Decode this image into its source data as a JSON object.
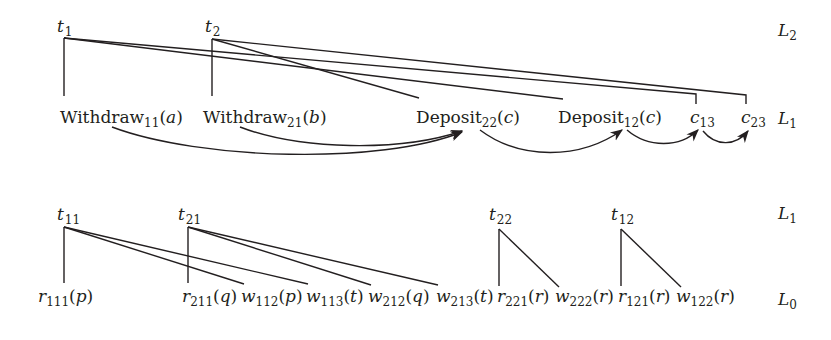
{
  "diagram": {
    "top": {
      "level_labels": [
        {
          "id": "L2",
          "base": "L",
          "sub": "2",
          "x": 778,
          "y": 36
        },
        {
          "id": "L1",
          "base": "L",
          "sub": "1",
          "x": 778,
          "y": 124
        }
      ],
      "roots": [
        {
          "id": "t1",
          "base": "t",
          "sub": "1",
          "x": 57,
          "y": 32,
          "apex": [
            64,
            38
          ]
        },
        {
          "id": "t2",
          "base": "t",
          "sub": "2",
          "x": 205,
          "y": 32,
          "apex": [
            212,
            39
          ]
        }
      ],
      "leaves": [
        {
          "id": "w11",
          "name": "Withdraw",
          "sub": "11",
          "arg": "a",
          "x": 60,
          "y": 123
        },
        {
          "id": "w21",
          "name": "Withdraw",
          "sub": "21",
          "arg": "b",
          "x": 203,
          "y": 123
        },
        {
          "id": "d22",
          "name": "Deposit",
          "sub": "22",
          "arg": "c",
          "x": 416,
          "y": 123
        },
        {
          "id": "d12",
          "name": "Deposit",
          "sub": "12",
          "arg": "c",
          "x": 558,
          "y": 123
        },
        {
          "id": "c13",
          "name": "c",
          "sub": "13",
          "arg": "",
          "x": 690,
          "y": 123
        },
        {
          "id": "c23",
          "name": "c",
          "sub": "23",
          "arg": "",
          "x": 741,
          "y": 123
        }
      ],
      "tree_edges": [
        {
          "from": "t1",
          "to": "w11"
        },
        {
          "from": "t1",
          "to": "d12"
        },
        {
          "from": "t1",
          "to": "c13"
        },
        {
          "from": "t2",
          "to": "w21"
        },
        {
          "from": "t2",
          "to": "d22"
        },
        {
          "from": "t2",
          "to": "c23"
        }
      ],
      "order_arrows": [
        {
          "from": "w11",
          "to": "d22"
        },
        {
          "from": "w21",
          "to": "d22"
        },
        {
          "from": "d22",
          "to": "d12"
        },
        {
          "from": "d12",
          "to": "c13"
        },
        {
          "from": "c13",
          "to": "c23"
        }
      ]
    },
    "bottom": {
      "level_labels": [
        {
          "id": "L1",
          "base": "L",
          "sub": "1",
          "x": 778,
          "y": 219
        },
        {
          "id": "L0",
          "base": "L",
          "sub": "0",
          "x": 778,
          "y": 305
        }
      ],
      "roots": [
        {
          "id": "t11",
          "base": "t",
          "sub": "11",
          "x": 57,
          "y": 220,
          "apex": [
            64,
            227
          ]
        },
        {
          "id": "t21",
          "base": "t",
          "sub": "21",
          "x": 178,
          "y": 220,
          "apex": [
            188,
            227
          ]
        },
        {
          "id": "t22",
          "base": "t",
          "sub": "22",
          "x": 489,
          "y": 220,
          "apex": [
            499,
            229
          ]
        },
        {
          "id": "t12",
          "base": "t",
          "sub": "12",
          "x": 611,
          "y": 220,
          "apex": [
            621,
            229
          ]
        }
      ],
      "leaves": [
        {
          "id": "r111",
          "op": "r",
          "sub": "111",
          "arg": "p",
          "x": 38,
          "y": 302
        },
        {
          "id": "r211",
          "op": "r",
          "sub": "211",
          "arg": "q",
          "x": 182,
          "y": 302
        },
        {
          "id": "w112",
          "op": "w",
          "sub": "112",
          "arg": "p",
          "x": 241,
          "y": 302
        },
        {
          "id": "w113",
          "op": "w",
          "sub": "113",
          "arg": "t",
          "x": 306,
          "y": 302
        },
        {
          "id": "w212",
          "op": "w",
          "sub": "212",
          "arg": "q",
          "x": 368,
          "y": 302
        },
        {
          "id": "w213",
          "op": "w",
          "sub": "213",
          "arg": "t",
          "x": 436,
          "y": 302
        },
        {
          "id": "r221",
          "op": "r",
          "sub": "221",
          "arg": "r",
          "x": 497,
          "y": 302
        },
        {
          "id": "w222",
          "op": "w",
          "sub": "222",
          "arg": "r",
          "x": 555,
          "y": 302
        },
        {
          "id": "r121",
          "op": "r",
          "sub": "121",
          "arg": "r",
          "x": 618,
          "y": 302
        },
        {
          "id": "w122",
          "op": "w",
          "sub": "122",
          "arg": "r",
          "x": 676,
          "y": 302
        }
      ],
      "tree_edges": [
        {
          "from": "t11",
          "to": "r111"
        },
        {
          "from": "t11",
          "to": "w112"
        },
        {
          "from": "t11",
          "to": "w113"
        },
        {
          "from": "t21",
          "to": "r211"
        },
        {
          "from": "t21",
          "to": "w212"
        },
        {
          "from": "t21",
          "to": "w213"
        },
        {
          "from": "t22",
          "to": "r221"
        },
        {
          "from": "t22",
          "to": "w222"
        },
        {
          "from": "t12",
          "to": "r121"
        },
        {
          "from": "t12",
          "to": "w122"
        }
      ]
    }
  }
}
